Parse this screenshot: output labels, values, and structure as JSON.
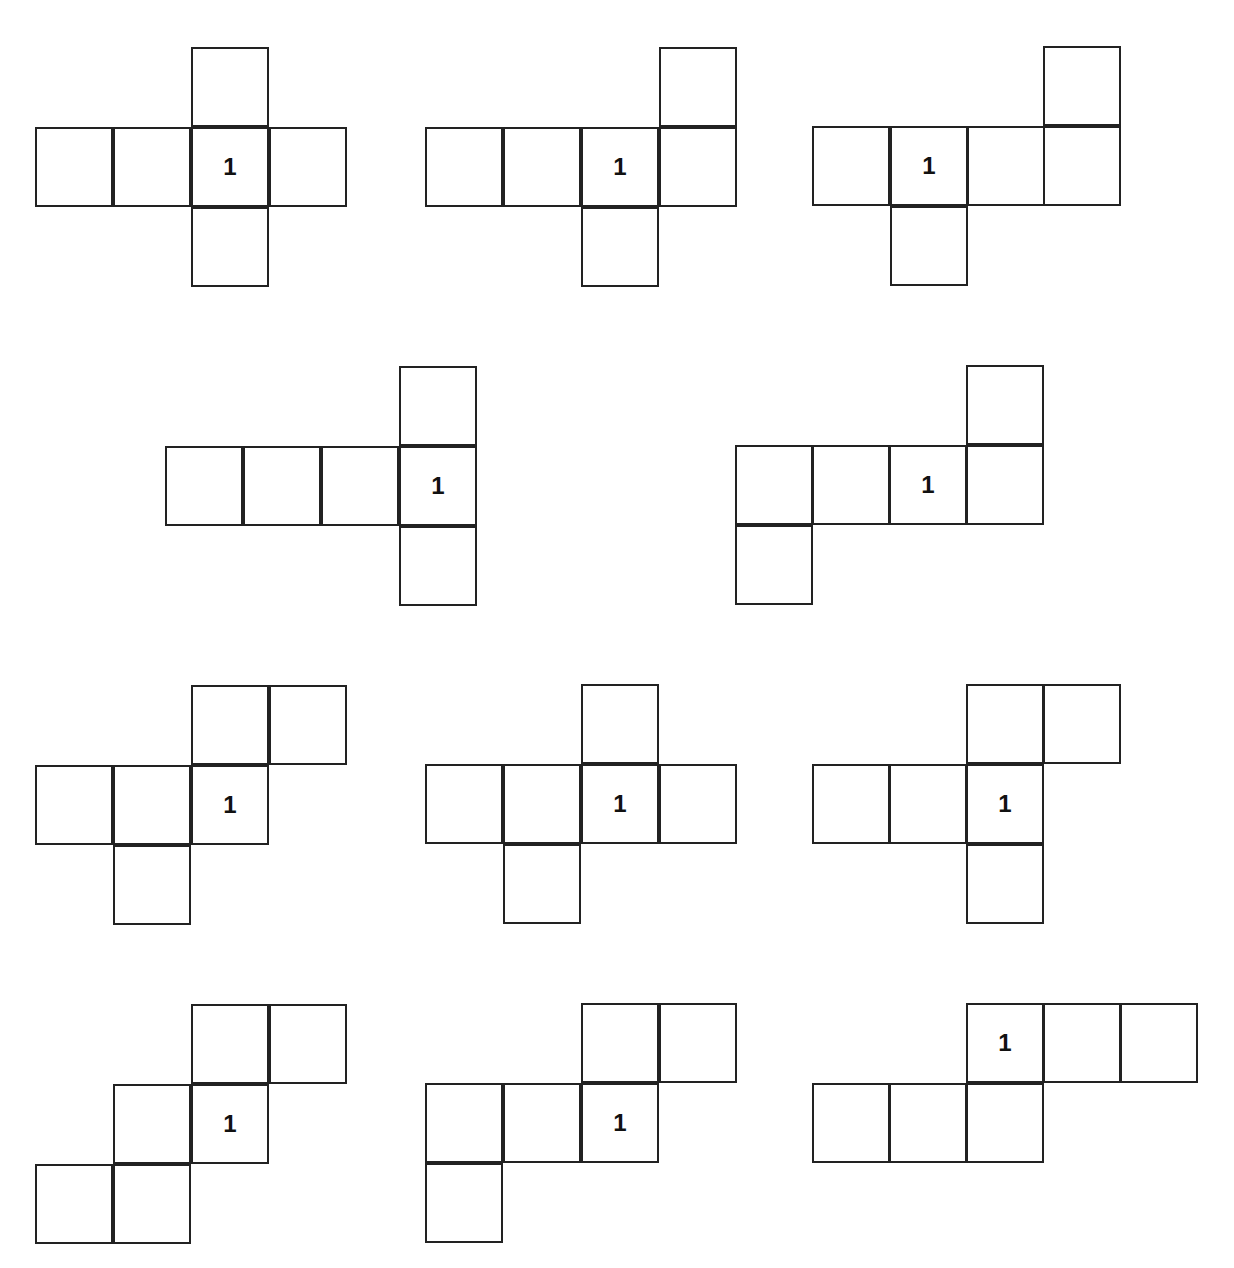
{
  "diagram": {
    "cell_w": 78,
    "cell_h": 80,
    "nets": [
      {
        "label": "1",
        "cells": [
          [
            191,
            47
          ],
          [
            35,
            127
          ],
          [
            113,
            127
          ],
          [
            191,
            127,
            "1"
          ],
          [
            269,
            127
          ],
          [
            191,
            207
          ]
        ]
      },
      {
        "label": "1",
        "cells": [
          [
            659,
            47
          ],
          [
            425,
            127
          ],
          [
            503,
            127
          ],
          [
            581,
            127,
            "1"
          ],
          [
            659,
            127
          ],
          [
            581,
            207
          ]
        ]
      },
      {
        "label": "1",
        "cells": [
          [
            1043,
            46
          ],
          [
            812,
            126
          ],
          [
            890,
            126,
            "1"
          ],
          [
            967,
            126
          ],
          [
            1043,
            126
          ],
          [
            890,
            206
          ]
        ]
      },
      {
        "label": "1",
        "cells": [
          [
            399,
            366
          ],
          [
            165,
            446
          ],
          [
            243,
            446
          ],
          [
            321,
            446
          ],
          [
            399,
            446,
            "1"
          ],
          [
            399,
            526
          ]
        ]
      },
      {
        "label": "1",
        "cells": [
          [
            966,
            365
          ],
          [
            735,
            445
          ],
          [
            812,
            445
          ],
          [
            889,
            445,
            "1"
          ],
          [
            966,
            445
          ],
          [
            735,
            525
          ]
        ]
      },
      {
        "label": "1",
        "cells": [
          [
            191,
            685
          ],
          [
            269,
            685
          ],
          [
            35,
            765
          ],
          [
            113,
            765
          ],
          [
            191,
            765,
            "1"
          ],
          [
            113,
            845
          ]
        ]
      },
      {
        "label": "1",
        "cells": [
          [
            581,
            684
          ],
          [
            425,
            764
          ],
          [
            503,
            764
          ],
          [
            581,
            764,
            "1"
          ],
          [
            659,
            764
          ],
          [
            503,
            844
          ]
        ]
      },
      {
        "label": "1",
        "cells": [
          [
            966,
            684
          ],
          [
            1043,
            684
          ],
          [
            812,
            764
          ],
          [
            889,
            764
          ],
          [
            966,
            764,
            "1"
          ],
          [
            966,
            844
          ]
        ]
      },
      {
        "label": "1",
        "cells": [
          [
            191,
            1004
          ],
          [
            269,
            1004
          ],
          [
            113,
            1084
          ],
          [
            191,
            1084,
            "1"
          ],
          [
            35,
            1164
          ],
          [
            113,
            1164
          ]
        ]
      },
      {
        "label": "1",
        "cells": [
          [
            581,
            1003
          ],
          [
            659,
            1003
          ],
          [
            425,
            1083
          ],
          [
            503,
            1083
          ],
          [
            581,
            1083,
            "1"
          ],
          [
            425,
            1163
          ]
        ]
      },
      {
        "label": "1",
        "cells": [
          [
            966,
            1003,
            "1"
          ],
          [
            1043,
            1003
          ],
          [
            1120,
            1003
          ],
          [
            812,
            1083
          ],
          [
            889,
            1083
          ],
          [
            966,
            1083
          ]
        ]
      }
    ]
  }
}
